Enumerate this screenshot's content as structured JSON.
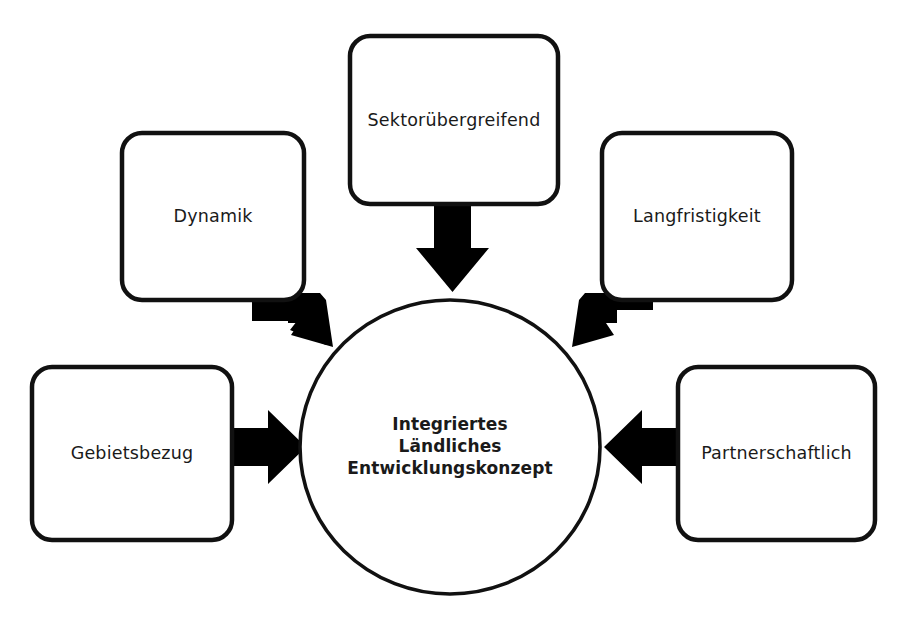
{
  "diagram": {
    "kind": "hub-and-spoke",
    "title": "Integriertes Ländliches Entwicklungskonzept",
    "colors": {
      "background": "#ffffff",
      "stroke": "#111111",
      "fill": "#ffffff",
      "text": "#1a1a1a",
      "arrow": "#000000"
    },
    "core": {
      "name": "integriertes-laendliches-entwicklungskonzept",
      "shape": "circle",
      "lines": [
        "Integriertes",
        "Ländliches",
        "Entwicklungskonzept"
      ]
    },
    "nodes": [
      {
        "id": "sektoruebergreifend",
        "label": "Sektorübergreifend",
        "position": "top",
        "shape": "rounded-rectangle"
      },
      {
        "id": "dynamik",
        "label": "Dynamik",
        "position": "top-left",
        "shape": "rounded-rectangle"
      },
      {
        "id": "langfristigkeit",
        "label": "Langfristigkeit",
        "position": "top-right",
        "shape": "rounded-rectangle"
      },
      {
        "id": "gebietsbezug",
        "label": "Gebietsbezug",
        "position": "left",
        "shape": "rounded-rectangle"
      },
      {
        "id": "partnerschaftlich",
        "label": "Partnerschaftlich",
        "position": "right",
        "shape": "rounded-rectangle"
      }
    ],
    "arrows": [
      {
        "id": "arrow-sektoruebergreifend-to-core",
        "from": "sektoruebergreifend",
        "to": "core",
        "direction": "down"
      },
      {
        "id": "arrow-dynamik-to-core",
        "from": "dynamik",
        "to": "core",
        "direction": "down-right"
      },
      {
        "id": "arrow-langfristigkeit-to-core",
        "from": "langfristigkeit",
        "to": "core",
        "direction": "down-left"
      },
      {
        "id": "arrow-gebietsbezug-to-core",
        "from": "gebietsbezug",
        "to": "core",
        "direction": "right"
      },
      {
        "id": "arrow-partnerschaftlich-to-core",
        "from": "partnerschaftlich",
        "to": "core",
        "direction": "left"
      }
    ],
    "caption": {
      "text": "",
      "visible": false
    }
  }
}
